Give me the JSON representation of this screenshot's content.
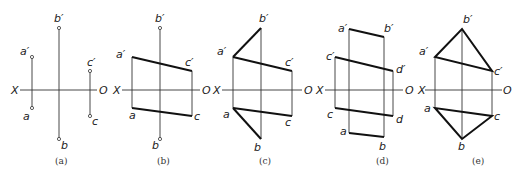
{
  "diagram": {
    "type": "orthographic projection sequence",
    "panels": [
      {
        "id": "a",
        "caption": "(a)",
        "axis": {
          "left": "X",
          "right": "O"
        },
        "points": [
          {
            "label": "a′",
            "x": 32,
            "y": 57
          },
          {
            "label": "a",
            "x": 32,
            "y": 108
          },
          {
            "label": "b′",
            "x": 59,
            "y": 28
          },
          {
            "label": "b",
            "x": 59,
            "y": 139
          },
          {
            "label": "c′",
            "x": 90,
            "y": 71
          },
          {
            "label": "c",
            "x": 90,
            "y": 116
          }
        ]
      },
      {
        "id": "b",
        "caption": "(b)",
        "axis": {
          "left": "X",
          "right": "O"
        },
        "labels": [
          "a′",
          "b′",
          "c′",
          "a",
          "b",
          "c"
        ]
      },
      {
        "id": "c",
        "caption": "(c)",
        "axis": {
          "left": "X",
          "right": "O"
        },
        "labels": [
          "a′",
          "b′",
          "c′",
          "a",
          "b",
          "c"
        ]
      },
      {
        "id": "d",
        "caption": "(d)",
        "axis": {
          "left": "X",
          "right": "O"
        },
        "labels": [
          "a′",
          "b′",
          "c′",
          "d′",
          "c",
          "d",
          "a",
          "b"
        ]
      },
      {
        "id": "e",
        "caption": "(e)",
        "axis": {
          "left": "X",
          "right": "O"
        },
        "labels": [
          "a′",
          "b′",
          "c′",
          "a",
          "b",
          "c"
        ]
      }
    ]
  },
  "text": {
    "X": "X",
    "O": "O",
    "ap": "a′",
    "a": "a",
    "bp": "b′",
    "b": "b",
    "cp": "c′",
    "c": "c",
    "dp": "d′",
    "d": "d",
    "cap_a": "(a)",
    "cap_b": "(b)",
    "cap_c": "(c)",
    "cap_d": "(d)",
    "cap_e": "(e)"
  }
}
